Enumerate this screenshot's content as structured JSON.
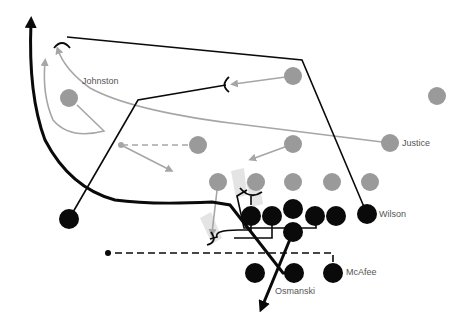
{
  "diagram": {
    "type": "football-play",
    "colors": {
      "offense": "#0a0a0a",
      "defense": "#9a9a9a",
      "defense_route": "#a6a6a6",
      "shade": "#e4e4e4",
      "label": "#555555"
    },
    "labels": {
      "johnston": "Johnston",
      "justice": "Justice",
      "wilson": "Wilson",
      "mcafee": "McAfee",
      "osmanski": "Osmanski"
    },
    "offense_players": [
      {
        "id": "left-end",
        "x": 69,
        "y": 219
      },
      {
        "id": "tackle-left",
        "x": 251,
        "y": 216
      },
      {
        "id": "guard-left",
        "x": 272,
        "y": 216
      },
      {
        "id": "center",
        "x": 293,
        "y": 211
      },
      {
        "id": "guard-right",
        "x": 315,
        "y": 216
      },
      {
        "id": "tackle-right",
        "x": 336,
        "y": 216
      },
      {
        "id": "wilson",
        "x": 367,
        "y": 214,
        "label": "Wilson"
      },
      {
        "id": "quarterback",
        "x": 293,
        "y": 232
      },
      {
        "id": "left-half",
        "x": 255,
        "y": 273
      },
      {
        "id": "osmanski",
        "x": 294,
        "y": 273,
        "label": "Osmanski"
      },
      {
        "id": "mcafee",
        "x": 333,
        "y": 273,
        "label": "McAfee"
      }
    ],
    "defense_players": [
      {
        "id": "johnston",
        "x": 69,
        "y": 98,
        "label": "Johnston"
      },
      {
        "id": "lb-center",
        "x": 293,
        "y": 76
      },
      {
        "id": "safety-right",
        "x": 437,
        "y": 96
      },
      {
        "id": "lb-left",
        "x": 198,
        "y": 145
      },
      {
        "id": "lb-mid",
        "x": 293,
        "y": 144
      },
      {
        "id": "justice",
        "x": 390,
        "y": 143,
        "label": "Justice"
      },
      {
        "id": "dl-1",
        "x": 218,
        "y": 182
      },
      {
        "id": "dl-2",
        "x": 256,
        "y": 182
      },
      {
        "id": "dl-3",
        "x": 293,
        "y": 182
      },
      {
        "id": "dl-4",
        "x": 332,
        "y": 182
      },
      {
        "id": "dl-5",
        "x": 370,
        "y": 182
      }
    ]
  }
}
